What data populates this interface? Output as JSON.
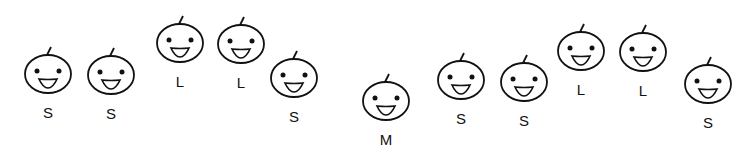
{
  "colors": {
    "stroke": "#111111",
    "background": "#ffffff"
  },
  "faces": [
    {
      "label": "S",
      "cx": 48,
      "cy": 74
    },
    {
      "label": "S",
      "cx": 111,
      "cy": 75
    },
    {
      "label": "L",
      "cx": 180,
      "cy": 43
    },
    {
      "label": "L",
      "cx": 241,
      "cy": 44
    },
    {
      "label": "S",
      "cx": 294,
      "cy": 78
    },
    {
      "label": "M",
      "cx": 386,
      "cy": 101
    },
    {
      "label": "S",
      "cx": 461,
      "cy": 80
    },
    {
      "label": "S",
      "cx": 524,
      "cy": 82
    },
    {
      "label": "L",
      "cx": 581,
      "cy": 51
    },
    {
      "label": "L",
      "cx": 643,
      "cy": 52
    },
    {
      "label": "S",
      "cx": 708,
      "cy": 84
    }
  ]
}
